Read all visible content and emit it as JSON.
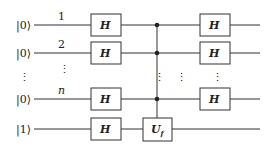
{
  "diagram": {
    "qubits": [
      {
        "state": "|0⟩",
        "index": "1"
      },
      {
        "state": "|0⟩",
        "index": "2"
      },
      {
        "state": "⋮",
        "index": "⋮"
      },
      {
        "state": "|0⟩",
        "index": "n"
      },
      {
        "state": "|1⟩",
        "index": ""
      }
    ],
    "gates": {
      "h": "H",
      "uf_main": "U",
      "uf_sub": "f"
    },
    "vdots": "⋮"
  }
}
